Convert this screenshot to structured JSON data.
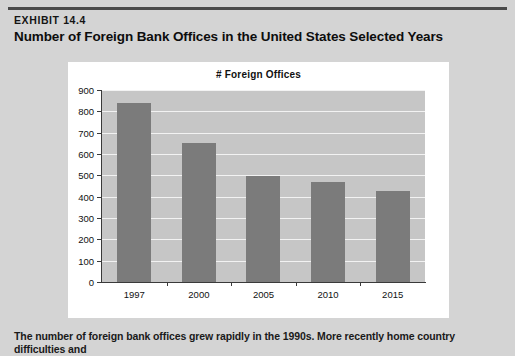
{
  "header": {
    "exhibit_number": "EXHIBIT 14.4",
    "title": "Number of Foreign Bank Offices in the United States Selected Years"
  },
  "caption": "The number of foreign bank offices grew rapidly in the 1990s. More recently home country difficulties and",
  "colors": {
    "page_background": "#d4d4d4",
    "card_background": "#ffffff",
    "plot_background": "#c6c6c6",
    "bar_fill": "#7b7b7b",
    "gridline": "#f2f2f2",
    "axis": "#3a3a3a",
    "rule": "#4a4a4a"
  },
  "chart_data": {
    "type": "bar",
    "title": "# Foreign Offices",
    "xlabel": "",
    "ylabel": "",
    "categories": [
      "1997",
      "2000",
      "2005",
      "2010",
      "2015"
    ],
    "values": [
      840,
      650,
      495,
      470,
      425
    ],
    "ylim": [
      0,
      900
    ],
    "ytick_step": 100,
    "yticks": [
      0,
      100,
      200,
      300,
      400,
      500,
      600,
      700,
      800,
      900
    ],
    "ytick_labels": [
      "0",
      "100",
      "200",
      "300",
      "400",
      "500",
      "600",
      "700",
      "800",
      "900"
    ],
    "grid": true,
    "grid_orientation": "horizontal",
    "legend": false,
    "legend_position": "none",
    "series": [
      {
        "name": "# Foreign Offices",
        "values": [
          840,
          650,
          495,
          470,
          425
        ]
      }
    ]
  }
}
